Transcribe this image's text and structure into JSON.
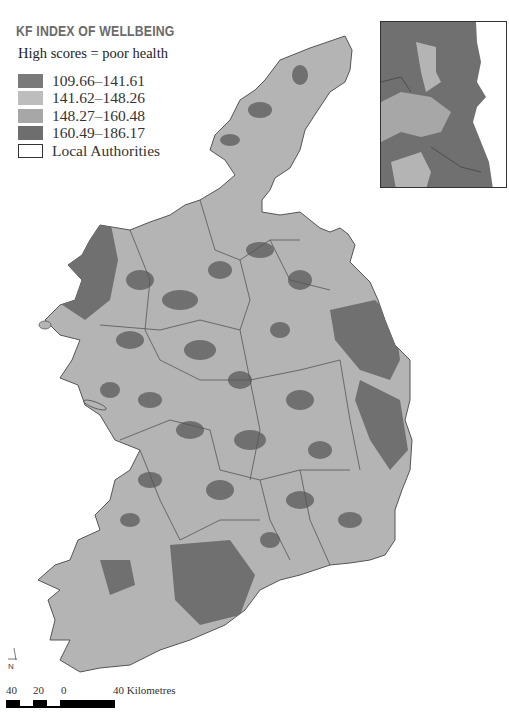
{
  "legend": {
    "title": "KF INDEX OF WELLBEING",
    "subtitle": "High scores = poor health",
    "items": [
      {
        "label": "109.66–141.61",
        "color": "#7a7a7a"
      },
      {
        "label": "141.62–148.26",
        "color": "#bdbdbd"
      },
      {
        "label": "148.27–160.48",
        "color": "#a7a7a7"
      },
      {
        "label": "160.49–186.17",
        "color": "#6e6e6e"
      },
      {
        "label": "Local Authorities",
        "color": "#ffffff"
      }
    ]
  },
  "map": {
    "base_color": "#b4b4b4",
    "dark_color": "#707070",
    "border_color": "#555555"
  },
  "north_arrow": {
    "label": "N"
  },
  "scale_bar": {
    "ticks": [
      "40",
      "20",
      "0",
      "40 Kilometres"
    ]
  }
}
